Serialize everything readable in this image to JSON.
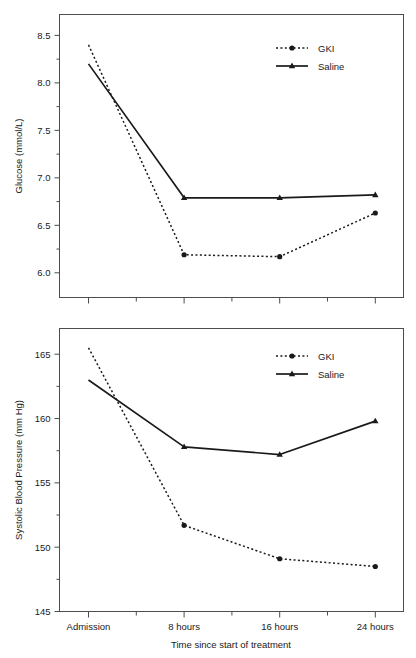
{
  "chart_data": [
    {
      "id": "glucose",
      "type": "line",
      "title": "",
      "xlabel": "",
      "ylabel": "Glucose (mmol/L)",
      "categories": [
        "Admission",
        "8 hours",
        "16 hours",
        "24 hours"
      ],
      "xtick_labels": [
        "",
        "",
        "",
        ""
      ],
      "ytick_labels": [
        "6.0",
        "6.5",
        "7.0",
        "7.5",
        "8.0",
        "8.5"
      ],
      "yticks": [
        6.0,
        6.5,
        7.0,
        7.5,
        8.0,
        8.5
      ],
      "ylim": [
        5.74,
        8.72
      ],
      "grid": false,
      "legend_position": "top-right",
      "series": [
        {
          "name": "GKI",
          "style": "dotted",
          "marker": "circle",
          "color": "#1a1a1a",
          "values": [
            8.4,
            6.19,
            6.17,
            6.63
          ]
        },
        {
          "name": "Saline",
          "style": "solid",
          "marker": "triangle",
          "color": "#1a1a1a",
          "values": [
            8.2,
            6.79,
            6.79,
            6.82
          ]
        }
      ]
    },
    {
      "id": "systolic-blood-pressure",
      "type": "line",
      "title": "",
      "xlabel": "Time since start of treatment",
      "ylabel": "Systolic Blood Pressure (mm Hg)",
      "categories": [
        "Admission",
        "8 hours",
        "16 hours",
        "24 hours"
      ],
      "xtick_labels": [
        "Admission",
        "8 hours",
        "16 hours",
        "24 hours"
      ],
      "ytick_labels": [
        "145",
        "150",
        "155",
        "160",
        "165"
      ],
      "yticks": [
        145,
        150,
        155,
        160,
        165
      ],
      "ylim": [
        145,
        167.0
      ],
      "grid": false,
      "legend_position": "top-right",
      "series": [
        {
          "name": "GKI",
          "style": "dotted",
          "marker": "circle",
          "color": "#1a1a1a",
          "values": [
            165.5,
            151.7,
            149.1,
            148.5
          ]
        },
        {
          "name": "Saline",
          "style": "solid",
          "marker": "triangle",
          "color": "#1a1a1a",
          "values": [
            163.0,
            157.8,
            157.2,
            159.8
          ]
        }
      ]
    }
  ],
  "legend": {
    "gki_label": "GKI",
    "saline_label": "Saline"
  },
  "colors": {
    "ink": "#1a1a1a",
    "frame": "#4d4d4d",
    "background": "#ffffff"
  }
}
